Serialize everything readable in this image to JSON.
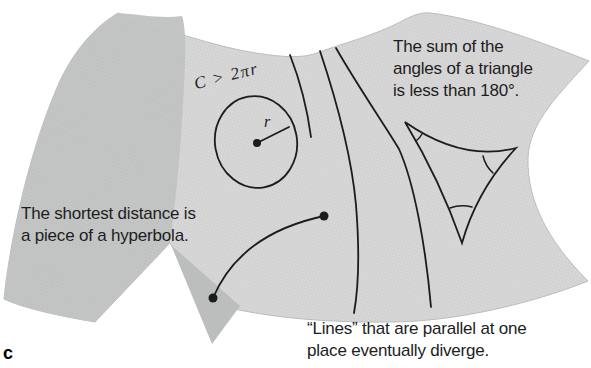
{
  "figure": {
    "panel_label": "c",
    "colors": {
      "background": "#ffffff",
      "surface": "#d6d6d6",
      "shading": "#c3c5c5",
      "fold": "#bdbfbf",
      "line": "#1c1c1c",
      "text": "#1d1d1d"
    },
    "annotations": {
      "circle_label": "C > 2πr",
      "radius_label": "r",
      "triangle_note_lines": [
        "The sum of the",
        "angles of a triangle",
        "is less than 180°."
      ],
      "geodesic_note_lines": [
        "The shortest distance is",
        "a piece of a hyperbola."
      ],
      "parallel_note_lines": [
        "“Lines” that are parallel at one",
        "place eventually diverge."
      ]
    }
  }
}
